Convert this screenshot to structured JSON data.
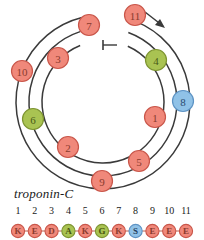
{
  "diagram": {
    "type": "helical-wheel",
    "label": "troponin-C",
    "arc_count": 3,
    "direction_marker": "arrow",
    "start_marker": "tick",
    "colors": {
      "salmon": "#f0887a",
      "salmon_stroke": "#c9564a",
      "green": "#a9c352",
      "green_stroke": "#7d9431",
      "blue": "#90c2e7",
      "blue_stroke": "#5d93c4",
      "line": "#3a3a3a",
      "text_dark": "#1a1a1a"
    },
    "wheel_nodes": [
      {
        "id": "1",
        "x": 155,
        "y": 117,
        "color": "salmon"
      },
      {
        "id": "2",
        "x": 68,
        "y": 147,
        "color": "salmon"
      },
      {
        "id": "3",
        "x": 58,
        "y": 58,
        "color": "salmon"
      },
      {
        "id": "4",
        "x": 156,
        "y": 60,
        "color": "green"
      },
      {
        "id": "5",
        "x": 139,
        "y": 161,
        "color": "salmon"
      },
      {
        "id": "6",
        "x": 33,
        "y": 119,
        "color": "green"
      },
      {
        "id": "7",
        "x": 89,
        "y": 25,
        "color": "salmon"
      },
      {
        "id": "8",
        "x": 183,
        "y": 101,
        "color": "blue"
      },
      {
        "id": "9",
        "x": 102,
        "y": 181,
        "color": "salmon"
      },
      {
        "id": "10",
        "x": 22,
        "y": 71,
        "color": "salmon"
      },
      {
        "id": "11",
        "x": 135,
        "y": 15,
        "color": "salmon"
      }
    ]
  },
  "sequence": {
    "title": "troponin-C",
    "indices": [
      "1",
      "2",
      "3",
      "4",
      "5",
      "6",
      "7",
      "8",
      "9",
      "10",
      "11"
    ],
    "residues": [
      {
        "index": "1",
        "letter": "K",
        "color": "salmon"
      },
      {
        "index": "2",
        "letter": "E",
        "color": "salmon"
      },
      {
        "index": "3",
        "letter": "D",
        "color": "salmon"
      },
      {
        "index": "4",
        "letter": "A",
        "color": "green"
      },
      {
        "index": "5",
        "letter": "K",
        "color": "salmon"
      },
      {
        "index": "6",
        "letter": "G",
        "color": "green"
      },
      {
        "index": "7",
        "letter": "K",
        "color": "salmon"
      },
      {
        "index": "8",
        "letter": "S",
        "color": "blue"
      },
      {
        "index": "9",
        "letter": "E",
        "color": "salmon"
      },
      {
        "index": "10",
        "letter": "E",
        "color": "salmon"
      },
      {
        "index": "11",
        "letter": "E",
        "color": "salmon"
      }
    ]
  }
}
